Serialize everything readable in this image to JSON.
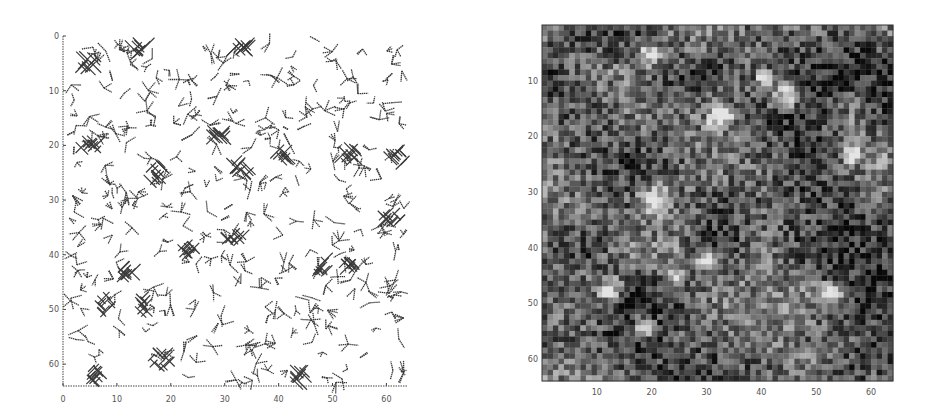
{
  "figure": {
    "panels": [
      {
        "id": "left",
        "kind": "orientation-glyph-field",
        "x_ticks": [
          "0",
          "10",
          "20",
          "30",
          "40",
          "50",
          "60"
        ],
        "y_ticks": [
          "0",
          "10",
          "20",
          "30",
          "40",
          "50",
          "60"
        ],
        "x_range": [
          0,
          64
        ],
        "y_range": [
          0,
          64
        ],
        "axes_style": "dotted left and bottom axes only"
      },
      {
        "id": "right",
        "kind": "grayscale-pixel-map",
        "grid_size": 64,
        "x_ticks": [
          "10",
          "20",
          "30",
          "40",
          "50",
          "60"
        ],
        "y_ticks": [
          "10",
          "20",
          "30",
          "40",
          "50",
          "60"
        ],
        "x_range": [
          0,
          64
        ],
        "y_range": [
          0,
          64
        ],
        "axes_style": "boxed image"
      }
    ]
  },
  "colors": {
    "ink": "#3a3a3a",
    "axis": "#444444",
    "background": "#ffffff"
  }
}
